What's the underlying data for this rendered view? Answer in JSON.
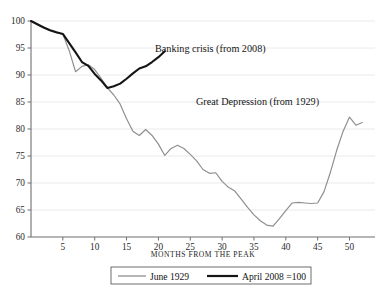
{
  "chart_data": {
    "type": "line",
    "title": "",
    "xlabel": "MONTHS FROM THE PEAK",
    "ylabel": "",
    "xlim": [
      0,
      54
    ],
    "ylim": [
      60,
      100
    ],
    "yticks": [
      60,
      65,
      70,
      75,
      80,
      85,
      90,
      95,
      100
    ],
    "xticks": [
      5,
      10,
      15,
      20,
      25,
      30,
      35,
      40,
      45,
      50
    ],
    "grid": "horizontal",
    "legend_position": "bottom-center",
    "series": [
      {
        "name": "June 1929",
        "label": "June 1929",
        "annotation": "Great Depression (from 1929)",
        "color": "#8f8f8f",
        "width": 1.2,
        "x": [
          0,
          1,
          2,
          3,
          4,
          5,
          6,
          7,
          8,
          9,
          10,
          11,
          12,
          13,
          14,
          15,
          16,
          17,
          18,
          19,
          20,
          21,
          22,
          23,
          24,
          25,
          26,
          27,
          28,
          29,
          30,
          31,
          32,
          33,
          34,
          35,
          36,
          37,
          38,
          39,
          40,
          41,
          42,
          43,
          44,
          45,
          46,
          47,
          48,
          49,
          50,
          51,
          52
        ],
        "values": [
          100,
          99.3,
          98.7,
          98.2,
          97.8,
          97.6,
          94.5,
          90.6,
          91.6,
          91.9,
          91.0,
          89.4,
          87.6,
          86.3,
          84.6,
          81.9,
          79.6,
          78.8,
          79.9,
          78.8,
          77.2,
          75.1,
          76.4,
          77.0,
          76.4,
          75.3,
          74.1,
          72.5,
          71.8,
          71.9,
          70.3,
          69.2,
          68.5,
          67.0,
          65.5,
          64.1,
          63.0,
          62.2,
          62.0,
          63.4,
          64.9,
          66.3,
          66.4,
          66.3,
          66.2,
          66.3,
          68.4,
          72.0,
          76.1,
          79.6,
          82.2,
          80.7,
          81.2
        ]
      },
      {
        "name": "April 2008 = 100",
        "label": "April 2008 =100",
        "annotation": "Banking crisis (from 2008)",
        "color": "#151515",
        "width": 2.1,
        "x": [
          0,
          1,
          2,
          3,
          4,
          5,
          6,
          7,
          8,
          9,
          10,
          11,
          12,
          13,
          14,
          15,
          16,
          17,
          18,
          19,
          20,
          21
        ],
        "values": [
          100,
          99.4,
          98.8,
          98.3,
          97.9,
          97.6,
          95.9,
          94.2,
          92.4,
          91.7,
          90.2,
          89.0,
          87.6,
          87.9,
          88.4,
          89.3,
          90.3,
          91.2,
          91.6,
          92.4,
          93.3,
          94.4
        ]
      }
    ]
  },
  "axis": {
    "x_title": "MONTHS FROM THE PEAK",
    "x_tick_labels": [
      "5",
      "10",
      "15",
      "20",
      "25",
      "30",
      "35",
      "40",
      "45",
      "50"
    ],
    "y_tick_labels": [
      "100",
      "95",
      "90",
      "85",
      "80",
      "75",
      "70",
      "65",
      "60"
    ]
  },
  "annotations": {
    "banking_crisis": "Banking crisis (from 2008)",
    "great_depression": "Great Depression (from 1929)"
  },
  "legend": {
    "items": [
      {
        "label": "June 1929",
        "color": "#8f8f8f"
      },
      {
        "label": "April 2008 =100",
        "color": "#151515"
      }
    ]
  },
  "colors": {
    "background": "#ffffff",
    "axis": "#6f6f6f",
    "gridline": "#e8e8e8",
    "depression_line": "#8f8f8f",
    "banking_line": "#151515",
    "text": "#141414"
  }
}
